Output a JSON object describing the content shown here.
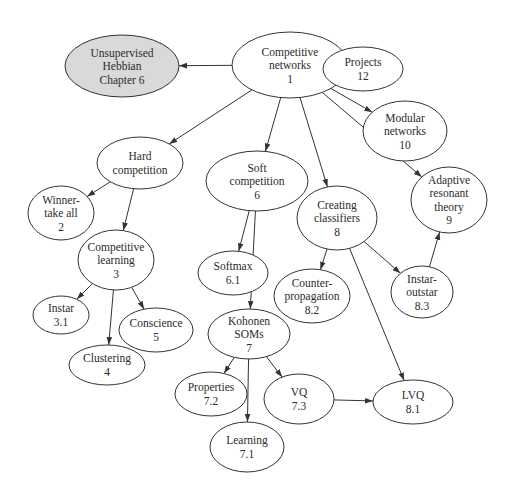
{
  "diagram": {
    "type": "concept-map",
    "colors": {
      "background": "#ffffff",
      "node_fill": "#ffffff",
      "highlight_fill": "#d9d9d9",
      "stroke": "#333333",
      "text": "#2b2b2b"
    },
    "nodes": [
      {
        "id": "hebbian",
        "lines": [
          "Unsupervised",
          "Hebbian",
          "Chapter 6"
        ],
        "cx": 122,
        "cy": 66,
        "rx": 57,
        "ry": 31,
        "highlight": true
      },
      {
        "id": "n1",
        "lines": [
          "Competitive",
          "networks",
          "1"
        ],
        "cx": 290,
        "cy": 65,
        "rx": 58,
        "ry": 33
      },
      {
        "id": "n12",
        "lines": [
          "Projects",
          "12"
        ],
        "cx": 363,
        "cy": 69,
        "rx": 40,
        "ry": 22
      },
      {
        "id": "n10",
        "lines": [
          "Modular",
          "networks",
          "10"
        ],
        "cx": 405,
        "cy": 131,
        "rx": 42,
        "ry": 30
      },
      {
        "id": "hard",
        "lines": [
          "Hard",
          "competition"
        ],
        "cx": 140,
        "cy": 163,
        "rx": 43,
        "ry": 26
      },
      {
        "id": "n6",
        "lines": [
          "Soft",
          "competition",
          "6"
        ],
        "cx": 257,
        "cy": 181,
        "rx": 51,
        "ry": 30
      },
      {
        "id": "n2",
        "lines": [
          "Winner-",
          "take all",
          "2"
        ],
        "cx": 61,
        "cy": 213,
        "rx": 33,
        "ry": 27
      },
      {
        "id": "n8",
        "lines": [
          "Creating",
          "classifiers",
          "8"
        ],
        "cx": 337,
        "cy": 218,
        "rx": 40,
        "ry": 32
      },
      {
        "id": "n9",
        "lines": [
          "Adaptive",
          "resonant",
          "theory",
          "9"
        ],
        "cx": 449,
        "cy": 200,
        "rx": 38,
        "ry": 33
      },
      {
        "id": "n3",
        "lines": [
          "Competitive",
          "learning",
          "3"
        ],
        "cx": 116,
        "cy": 260,
        "rx": 38,
        "ry": 30
      },
      {
        "id": "n6_1",
        "lines": [
          "Softmax",
          "6.1"
        ],
        "cx": 233,
        "cy": 273,
        "rx": 35,
        "ry": 22
      },
      {
        "id": "n8_2",
        "lines": [
          "Counter-",
          "propagation",
          "8.2"
        ],
        "cx": 312,
        "cy": 296,
        "rx": 38,
        "ry": 27
      },
      {
        "id": "n8_3",
        "lines": [
          "Instar-",
          "outstar",
          "8.3"
        ],
        "cx": 422,
        "cy": 292,
        "rx": 31,
        "ry": 26
      },
      {
        "id": "n3_1",
        "lines": [
          "Instar",
          "3.1"
        ],
        "cx": 61,
        "cy": 315,
        "rx": 28,
        "ry": 19
      },
      {
        "id": "n5",
        "lines": [
          "Conscience",
          "5"
        ],
        "cx": 156,
        "cy": 330,
        "rx": 37,
        "ry": 22
      },
      {
        "id": "n7",
        "lines": [
          "Kohonen",
          "SOMs",
          "7"
        ],
        "cx": 249,
        "cy": 334,
        "rx": 41,
        "ry": 25
      },
      {
        "id": "n4",
        "lines": [
          "Clustering",
          "4"
        ],
        "cx": 107,
        "cy": 365,
        "rx": 38,
        "ry": 20
      },
      {
        "id": "n7_2",
        "lines": [
          "Properties",
          "7.2"
        ],
        "cx": 211,
        "cy": 394,
        "rx": 36,
        "ry": 22
      },
      {
        "id": "n7_3",
        "lines": [
          "VQ",
          "7.3"
        ],
        "cx": 299,
        "cy": 399,
        "rx": 35,
        "ry": 25
      },
      {
        "id": "n8_1",
        "lines": [
          "LVQ",
          "8.1"
        ],
        "cx": 413,
        "cy": 402,
        "rx": 40,
        "ry": 22
      },
      {
        "id": "n7_1",
        "lines": [
          "Learning",
          "7.1"
        ],
        "cx": 247,
        "cy": 447,
        "rx": 37,
        "ry": 25
      }
    ],
    "edges": [
      {
        "from": "n1",
        "to": "hebbian"
      },
      {
        "from": "n1",
        "to": "n12"
      },
      {
        "from": "n1",
        "to": "n10"
      },
      {
        "from": "n1",
        "to": "hard"
      },
      {
        "from": "n1",
        "to": "n6"
      },
      {
        "from": "n1",
        "to": "n8"
      },
      {
        "from": "n1",
        "to": "n9"
      },
      {
        "from": "hard",
        "to": "n2"
      },
      {
        "from": "hard",
        "to": "n3"
      },
      {
        "from": "n6",
        "to": "n6_1"
      },
      {
        "from": "n6",
        "to": "n7"
      },
      {
        "from": "n8",
        "to": "n8_2"
      },
      {
        "from": "n8",
        "to": "n8_3"
      },
      {
        "from": "n8",
        "to": "n8_1"
      },
      {
        "from": "n8_3",
        "to": "n9"
      },
      {
        "from": "n3",
        "to": "n3_1"
      },
      {
        "from": "n3",
        "to": "n5"
      },
      {
        "from": "n3",
        "to": "n4"
      },
      {
        "from": "n7",
        "to": "n7_2"
      },
      {
        "from": "n7",
        "to": "n7_1"
      },
      {
        "from": "n7",
        "to": "n7_3"
      },
      {
        "from": "n7_3",
        "to": "n8_1"
      }
    ]
  }
}
